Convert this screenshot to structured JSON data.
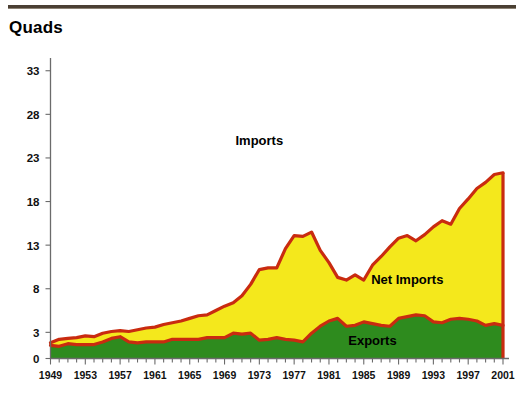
{
  "title": "Quads",
  "colors": {
    "imports_line": "#C92B10",
    "net_imports_fill": "#F4E81C",
    "exports_fill": "#2E8B1E",
    "axis": "#6B6B6B",
    "top_rule": "#4A3F33",
    "text": "#111111",
    "background": "#FFFFFF"
  },
  "labels": {
    "imports": "Imports",
    "net_imports": "Net Imports",
    "exports": "Exports"
  },
  "chart_data": {
    "type": "area",
    "title": "Quads",
    "xlabel": "",
    "ylabel": "Quads",
    "ylim": [
      0,
      35
    ],
    "xlim": [
      1949,
      2001
    ],
    "grid": false,
    "legend_position": "inline-annotations",
    "ytick_values": [
      0,
      3,
      8,
      13,
      18,
      23,
      28,
      33
    ],
    "ytick_labels": [
      "0",
      "3",
      "8",
      "13",
      "18",
      "23",
      "28",
      "33"
    ],
    "xtick_labels": [
      "1949",
      "1953",
      "1957",
      "1961",
      "1965",
      "1969",
      "1973",
      "1977",
      "1981",
      "1985",
      "1989",
      "1993",
      "1997",
      "2001"
    ],
    "xtick_values": [
      1949,
      1953,
      1957,
      1961,
      1965,
      1969,
      1973,
      1977,
      1981,
      1985,
      1989,
      1993,
      1997,
      2001
    ],
    "x": [
      1949,
      1950,
      1951,
      1952,
      1953,
      1954,
      1955,
      1956,
      1957,
      1958,
      1959,
      1960,
      1961,
      1962,
      1963,
      1964,
      1965,
      1966,
      1967,
      1968,
      1969,
      1970,
      1971,
      1972,
      1973,
      1974,
      1975,
      1976,
      1977,
      1978,
      1979,
      1980,
      1981,
      1982,
      1983,
      1984,
      1985,
      1986,
      1987,
      1988,
      1989,
      1990,
      1991,
      1992,
      1993,
      1994,
      1995,
      1996,
      1997,
      1998,
      1999,
      2000,
      2001
    ],
    "series": [
      {
        "name": "Imports",
        "values": [
          1.8,
          2.2,
          2.3,
          2.4,
          2.6,
          2.5,
          2.9,
          3.1,
          3.2,
          3.1,
          3.3,
          3.5,
          3.6,
          3.9,
          4.1,
          4.3,
          4.6,
          4.9,
          5.0,
          5.5,
          6.0,
          6.4,
          7.2,
          8.5,
          10.2,
          10.4,
          10.4,
          12.6,
          14.1,
          14.0,
          14.5,
          12.4,
          11.0,
          9.3,
          9.0,
          9.6,
          9.0,
          10.7,
          11.7,
          12.8,
          13.8,
          14.1,
          13.5,
          14.2,
          15.1,
          15.8,
          15.4,
          17.2,
          18.3,
          19.5,
          20.2,
          21.1,
          21.3
        ]
      },
      {
        "name": "Exports",
        "values": [
          1.5,
          1.4,
          1.7,
          1.6,
          1.6,
          1.6,
          1.9,
          2.3,
          2.5,
          1.9,
          1.8,
          1.9,
          1.9,
          1.9,
          2.2,
          2.2,
          2.2,
          2.2,
          2.4,
          2.4,
          2.4,
          2.9,
          2.8,
          2.9,
          2.1,
          2.2,
          2.4,
          2.2,
          2.1,
          1.9,
          2.9,
          3.7,
          4.3,
          4.6,
          3.7,
          3.8,
          4.2,
          4.0,
          3.8,
          3.7,
          4.6,
          4.8,
          5.0,
          4.9,
          4.2,
          4.1,
          4.5,
          4.6,
          4.5,
          4.3,
          3.8,
          4.0,
          3.8
        ]
      },
      {
        "name": "Net Imports",
        "values": [
          0.3,
          0.8,
          0.6,
          0.8,
          1.0,
          0.9,
          1.0,
          0.8,
          0.7,
          1.2,
          1.5,
          1.6,
          1.7,
          2.0,
          1.9,
          2.1,
          2.4,
          2.7,
          2.6,
          3.1,
          3.6,
          3.5,
          4.4,
          5.6,
          8.1,
          8.2,
          8.0,
          10.4,
          12.0,
          12.1,
          11.6,
          8.7,
          6.7,
          4.7,
          5.3,
          5.8,
          4.8,
          6.7,
          7.9,
          9.1,
          9.2,
          9.3,
          8.5,
          9.3,
          10.9,
          11.7,
          10.9,
          12.6,
          13.8,
          15.2,
          16.4,
          17.1,
          17.5
        ]
      }
    ],
    "peak_imports": {
      "year": 2001,
      "value": 21.3
    },
    "annotations": [
      {
        "text": "Imports",
        "x": 1973,
        "y": 24.5
      },
      {
        "text": "Net Imports",
        "x": 1990,
        "y": 8.5
      },
      {
        "text": "Exports",
        "x": 1986,
        "y": 1.6
      }
    ]
  }
}
